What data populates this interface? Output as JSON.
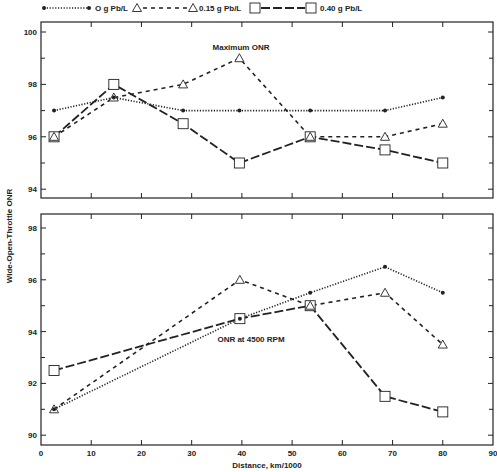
{
  "chart_data": [
    {
      "id": "upper",
      "type": "line",
      "title": "",
      "annotation": "Maximum ONR",
      "xlabel": "",
      "ylabel": "Wide-Open-Throttle ONR",
      "xlim": [
        0,
        90
      ],
      "ylim": [
        93.5,
        100.5
      ],
      "yticks": [
        94,
        96,
        98,
        100
      ],
      "yminor": [
        95,
        97,
        99
      ],
      "xticks": [
        0,
        10,
        20,
        30,
        40,
        50,
        60,
        70,
        80,
        90
      ],
      "grid": false,
      "series": [
        {
          "name": "O g Pb/L",
          "style": "dotted",
          "marker": "dot",
          "x": [
            2.6,
            14.5,
            28.3,
            39.5,
            53.6,
            68.5,
            80
          ],
          "y": [
            97.0,
            97.5,
            97.0,
            97.0,
            97.0,
            97.0,
            97.5
          ]
        },
        {
          "name": "0.15 g Pb/L",
          "style": "dashed",
          "marker": "triangle",
          "x": [
            2.6,
            14.5,
            28.3,
            39.5,
            53.6,
            68.5,
            80
          ],
          "y": [
            96.0,
            97.5,
            98.0,
            99.0,
            96.0,
            96.0,
            96.5
          ]
        },
        {
          "name": "0.40 g Pb/L",
          "style": "longdash",
          "marker": "square",
          "x": [
            2.6,
            14.5,
            28.3,
            39.5,
            53.6,
            68.5,
            80
          ],
          "y": [
            96.0,
            98.0,
            96.5,
            95.0,
            96.0,
            95.5,
            95.0
          ]
        }
      ]
    },
    {
      "id": "lower",
      "type": "line",
      "title": "",
      "annotation": "ONR at 4500 RPM",
      "xlabel": "Distance, km/1000",
      "ylabel": "Wide-Open-Throttle ONR",
      "xlim": [
        0,
        90
      ],
      "ylim": [
        89.6,
        98.6
      ],
      "yticks": [
        90,
        92,
        94,
        96,
        98
      ],
      "yminor": [
        91,
        93,
        95,
        97
      ],
      "xticks": [
        0,
        10,
        20,
        30,
        40,
        50,
        60,
        70,
        80,
        90
      ],
      "grid": false,
      "series": [
        {
          "name": "O g Pb/L",
          "style": "dotted",
          "marker": "dot",
          "x": [
            2.6,
            39.6,
            53.6,
            68.5,
            80
          ],
          "y": [
            91.0,
            94.5,
            95.5,
            96.5,
            95.5
          ]
        },
        {
          "name": "0.15 g Pb/L",
          "style": "dashed",
          "marker": "triangle",
          "x": [
            2.6,
            39.6,
            53.6,
            68.5,
            80
          ],
          "y": [
            91.0,
            96.0,
            95.0,
            95.5,
            93.5
          ]
        },
        {
          "name": "0.40 g Pb/L",
          "style": "longdash",
          "marker": "square",
          "x": [
            2.6,
            39.6,
            53.6,
            68.5,
            80
          ],
          "y": [
            92.5,
            94.5,
            95.0,
            91.5,
            90.9
          ]
        }
      ]
    }
  ],
  "legend": {
    "items": [
      {
        "label": "O g Pb/L",
        "style": "dotted",
        "marker": "dot"
      },
      {
        "label": "0.15 g Pb/L",
        "style": "dashed",
        "marker": "triangle"
      },
      {
        "label": "0.40 g Pb/L",
        "style": "longdash",
        "marker": "square"
      }
    ],
    "position": "top"
  },
  "axes": {
    "ylabel": "Wide-Open-Throttle ONR",
    "xlabel": "Distance, km/1000",
    "x_tick_labels": [
      "0",
      "10",
      "20",
      "30",
      "40",
      "50",
      "60",
      "70",
      "80",
      "90"
    ]
  },
  "colors": {
    "ink": "#222222",
    "background": "#ffffff"
  }
}
